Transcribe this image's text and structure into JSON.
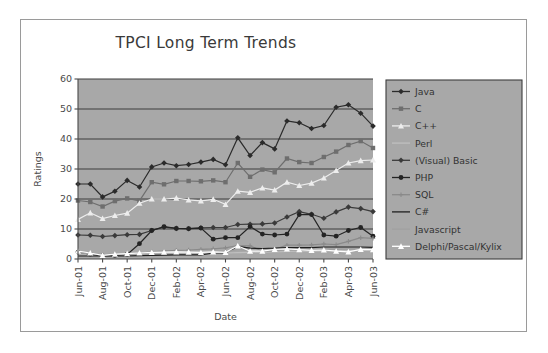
{
  "chart_data": {
    "type": "line",
    "title": "TPCI Long Term Trends",
    "xlabel": "Date",
    "ylabel": "Ratings",
    "ylim": [
      0,
      60
    ],
    "yticks": [
      0,
      10,
      20,
      30,
      40,
      50,
      60
    ],
    "grid": "horizontal",
    "legend_position": "right",
    "categories": [
      "Jun-01",
      "Jul-01",
      "Aug-01",
      "Sep-01",
      "Oct-01",
      "Nov-01",
      "Dec-01",
      "Jan-02",
      "Feb-02",
      "Mar-02",
      "Apr-02",
      "May-02",
      "Jun-02",
      "Jul-02",
      "Aug-02",
      "Sep-02",
      "Oct-02",
      "Nov-02",
      "Dec-02",
      "Jan-03",
      "Feb-03",
      "Mar-03",
      "Apr-03",
      "May-03",
      "Jun-03"
    ],
    "tick_labels": [
      "Jun-01",
      "Aug-01",
      "Oct-01",
      "Dec-01",
      "Feb-02",
      "Apr-02",
      "Jun-02",
      "Aug-02",
      "Oct-02",
      "Dec-02",
      "Feb-03",
      "Apr-03",
      "Jun-03"
    ],
    "series": [
      {
        "name": "Java",
        "color": "#2b2b2b",
        "marker": "diamond",
        "values": [
          25.0,
          25.0,
          20.7,
          22.6,
          26.2,
          24.0,
          30.7,
          32.0,
          31.1,
          31.5,
          32.3,
          33.2,
          31.4,
          40.4,
          34.5,
          38.8,
          36.7,
          46.0,
          45.4,
          43.5,
          44.5,
          50.6,
          51.4,
          48.6,
          44.3
        ]
      },
      {
        "name": "C",
        "color": "#6e6e6e",
        "marker": "square",
        "values": [
          19.5,
          19.0,
          17.5,
          19.3,
          20.2,
          19.4,
          25.6,
          24.9,
          26.0,
          26.0,
          25.9,
          26.2,
          25.6,
          32.0,
          27.4,
          29.8,
          28.9,
          33.5,
          32.3,
          32.0,
          34.0,
          35.8,
          38.0,
          39.3,
          37.0
        ]
      },
      {
        "name": "C++",
        "color": "#ededed",
        "marker": "triangle",
        "values": [
          13.2,
          15.4,
          13.5,
          14.5,
          15.3,
          18.6,
          20.0,
          20.0,
          20.3,
          19.7,
          19.4,
          19.9,
          18.2,
          22.6,
          22.2,
          23.7,
          23.0,
          25.6,
          24.5,
          25.3,
          27.0,
          29.5,
          32.0,
          32.8,
          33.0
        ]
      },
      {
        "name": "Perl",
        "color": "#bfbfbf",
        "marker": "none",
        "values": [
          1.8,
          1.6,
          1.0,
          1.3,
          1.5,
          1.6,
          1.8,
          1.9,
          2.0,
          1.9,
          1.9,
          2.0,
          2.0,
          2.1,
          2.2,
          2.3,
          2.4,
          2.5,
          2.6,
          2.6,
          2.7,
          2.8,
          2.9,
          3.0,
          3.0
        ]
      },
      {
        "name": "(Visual) Basic",
        "color": "#3a3a3a",
        "marker": "diamond",
        "values": [
          8.0,
          7.9,
          7.5,
          7.8,
          8.1,
          8.2,
          9.5,
          10.6,
          10.2,
          10.1,
          10.4,
          10.5,
          10.5,
          11.5,
          11.6,
          11.7,
          12.0,
          14.0,
          15.8,
          14.9,
          13.6,
          15.7,
          17.3,
          16.8,
          15.8
        ]
      },
      {
        "name": "PHP",
        "color": "#242424",
        "marker": "circle",
        "values": [
          2.3,
          1.6,
          1.0,
          1.2,
          1.5,
          5.1,
          9.5,
          10.8,
          10.2,
          10.1,
          10.3,
          6.6,
          7.1,
          7.1,
          10.8,
          8.3,
          8.0,
          8.3,
          14.8,
          14.8,
          8.0,
          7.6,
          9.5,
          10.5,
          7.6
        ]
      },
      {
        "name": "SQL",
        "color": "#8a8a8a",
        "marker": "plus",
        "values": [
          2.2,
          1.8,
          1.4,
          1.6,
          1.8,
          1.9,
          2.4,
          2.6,
          2.9,
          3.0,
          3.2,
          3.4,
          3.7,
          4.5,
          4.4,
          2.6,
          3.2,
          4.6,
          4.6,
          4.7,
          5.0,
          4.8,
          5.9,
          7.1,
          6.9
        ]
      },
      {
        "name": "C#",
        "color": "#1f1f1f",
        "marker": "none",
        "values": [
          1.0,
          1.0,
          1.0,
          1.0,
          1.0,
          1.1,
          1.2,
          1.3,
          1.4,
          1.4,
          1.4,
          2.0,
          2.0,
          4.2,
          3.6,
          3.5,
          3.6,
          3.8,
          3.8,
          3.8,
          4.0,
          4.0,
          4.0,
          4.0,
          3.9
        ]
      },
      {
        "name": "Javascript",
        "color": "#a0a0a0",
        "marker": "none",
        "values": [
          2.0,
          1.8,
          1.3,
          1.5,
          1.7,
          1.8,
          2.0,
          2.0,
          2.1,
          2.1,
          2.1,
          2.2,
          2.3,
          3.2,
          2.7,
          2.5,
          2.6,
          3.1,
          3.0,
          3.0,
          3.1,
          3.2,
          3.3,
          3.4,
          3.3
        ]
      },
      {
        "name": "Delphi/Pascal/Kylix",
        "color": "#ffffff",
        "marker": "triangle",
        "values": [
          2.6,
          2.0,
          1.2,
          1.6,
          1.8,
          2.0,
          2.2,
          2.3,
          2.4,
          2.3,
          2.2,
          2.4,
          2.2,
          4.4,
          2.6,
          2.6,
          3.2,
          3.4,
          3.1,
          2.9,
          3.0,
          2.6,
          2.4,
          3.2,
          3.1
        ]
      }
    ]
  },
  "frame": {
    "plot_bg": "#a8a8a8",
    "grid_color": "#3d3d3d",
    "axis_color": "#4a4a4a",
    "legend_bg": "#a8a8a8",
    "legend_border": "#3d3d3d"
  }
}
